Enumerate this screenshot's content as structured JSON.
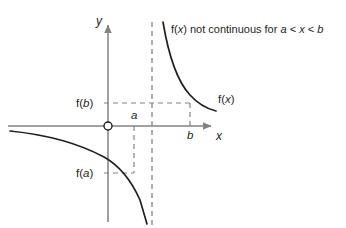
{
  "figure": {
    "kind": "math-function-graph",
    "background_color": "#ffffff",
    "axis_color": "#808285",
    "curve_color": "#231f20",
    "dash_color": "#808285",
    "text_color": "#231f20",
    "annotation": "f(x) not continuous for a < x < b",
    "labels": {
      "y_axis": "y",
      "x_axis": "x",
      "curve": "f(x)",
      "value_at_b": "f(b)",
      "value_at_a": "f(a)",
      "tick_a": "a",
      "tick_b": "b",
      "origin": "O"
    }
  },
  "chart_data": {
    "type": "line",
    "title": "",
    "subtitle": "",
    "xlabel": "x",
    "ylabel": "y",
    "annotations": [
      {
        "text": "f(x) not continuous for a < x < b",
        "x_px": 171,
        "y_px": 24
      },
      {
        "text": "f(x)",
        "x_px": 218,
        "y_px": 94
      }
    ],
    "grid": false,
    "legend": "none",
    "axes": {
      "origin_px": [
        108,
        126
      ],
      "x_axis_y_px": 126,
      "y_axis_x_px": 108,
      "x_axis_span_px": [
        8,
        214
      ],
      "y_axis_span_px": [
        22,
        222
      ],
      "x_arrow": true,
      "y_arrow": true,
      "origin_marker": "open-circle"
    },
    "vertical_asymptote": {
      "x_px": 152,
      "style": "dashed",
      "label": ""
    },
    "tick_marks": [
      {
        "label": "a",
        "axis": "x",
        "x_px": 134,
        "guide": "dashed-down-to-f(a)"
      },
      {
        "label": "b",
        "axis": "x",
        "x_px": 190,
        "guide": "dashed-up-to-f(b)"
      }
    ],
    "value_guides": [
      {
        "label": "f(b)",
        "axis": "y",
        "y_px": 103,
        "guide": "dashed-right-to-b"
      },
      {
        "label": "f(a)",
        "axis": "y",
        "y_px": 173,
        "guide": "dashed-right-to-a"
      }
    ],
    "series": [
      {
        "name": "f(x) left branch",
        "description": "decreasing branch approaching vertical asymptote from the left, passing through (a, f(a))",
        "points_px": [
          [
            10,
            131
          ],
          [
            28,
            133
          ],
          [
            48,
            137
          ],
          [
            68,
            142
          ],
          [
            88,
            149
          ],
          [
            104,
            157
          ],
          [
            116,
            166
          ],
          [
            126,
            176
          ],
          [
            133,
            186
          ],
          [
            139,
            198
          ],
          [
            144,
            212
          ],
          [
            147,
            224
          ]
        ]
      },
      {
        "name": "f(x) right branch",
        "description": "decreasing branch falling from near the vertical asymptote, passing through (b, f(b))",
        "points_px": [
          [
            163,
            22
          ],
          [
            166,
            34
          ],
          [
            169,
            48
          ],
          [
            173,
            62
          ],
          [
            178,
            75
          ],
          [
            184,
            87
          ],
          [
            190,
            95
          ],
          [
            196,
            101
          ],
          [
            203,
            106
          ],
          [
            210,
            109
          ],
          [
            216,
            111
          ]
        ]
      }
    ]
  }
}
